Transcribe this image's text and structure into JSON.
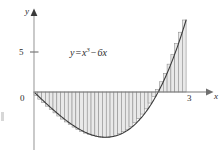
{
  "figure": {
    "kind": "riemann-sum-plot",
    "background_color": "#ffffff",
    "equation": {
      "lhs": "y",
      "equals": "=",
      "base": "x",
      "exponent": "3",
      "minus": "−",
      "term": "6x",
      "full_text": "y = x³ − 6x"
    },
    "axes": {
      "x_label": "x",
      "y_label": "y",
      "axis_color": "#7a7a7a",
      "origin_px": {
        "x": 34,
        "y": 92
      },
      "x_scale_px_per_unit": 50.7,
      "y_scale_px_per_unit": 8.0,
      "x_ticks": [
        {
          "label": "0",
          "value": 0
        },
        {
          "label": "3",
          "value": 3
        }
      ],
      "y_ticks": [
        {
          "label": "5",
          "value": 5
        }
      ]
    },
    "rectangles": {
      "count": 40,
      "fill_color": "#e9e9e9",
      "stroke_color": "#8a8a8a",
      "interval": [
        0,
        3
      ]
    },
    "curve": {
      "stroke_color": "#3a3a3a",
      "domain": [
        0,
        3
      ]
    }
  },
  "chart_data": {
    "type": "area",
    "title": "",
    "subtitle": "",
    "xlabel": "x",
    "ylabel": "y",
    "annotations": [
      "y = x³ − 6x"
    ],
    "legend": [],
    "grid": false,
    "xlim": [
      0,
      3.5
    ],
    "ylim": [
      -6.5,
      9.5
    ],
    "xticks": [
      0,
      3
    ],
    "xticklabels": [
      "0",
      "3"
    ],
    "yticks": [
      5
    ],
    "yticklabels": [
      "5"
    ],
    "function": "x^3 - 6x",
    "riemann": {
      "method": "right-endpoint",
      "n": 40,
      "a": 0,
      "b": 3,
      "dx": 0.075
    },
    "series": [
      {
        "name": "y = x^3 - 6x",
        "x": [
          0,
          0.15,
          0.3,
          0.45,
          0.6,
          0.75,
          0.9,
          1.05,
          1.2,
          1.35,
          1.414,
          1.5,
          1.65,
          1.8,
          1.95,
          2.1,
          2.25,
          2.4,
          2.449,
          2.55,
          2.7,
          2.85,
          3
        ],
        "values": [
          0,
          -0.897,
          -1.773,
          -2.609,
          -3.384,
          -4.078,
          -4.671,
          -5.142,
          -5.472,
          -5.639,
          -5.657,
          -5.625,
          -5.406,
          -4.968,
          -4.289,
          -3.339,
          -1.861,
          -0.576,
          0,
          1.283,
          3.483,
          5.048,
          9
        ]
      }
    ]
  }
}
